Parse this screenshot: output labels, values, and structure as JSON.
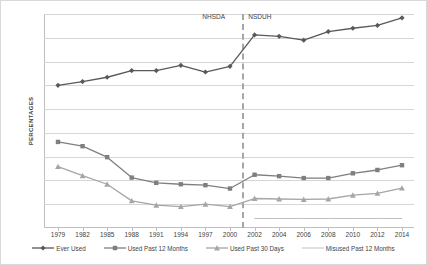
{
  "chart_data": {
    "type": "line",
    "title": "",
    "xlabel": "",
    "ylabel": "PERCENTAGES",
    "ylim": [
      0,
      45
    ],
    "ytick_step": 5,
    "yticks": [
      0,
      5,
      10,
      15,
      20,
      25,
      30,
      35,
      40,
      45
    ],
    "grid": "horizontal",
    "legend_position": "bottom",
    "x": [
      1979,
      1982,
      1985,
      1988,
      1991,
      1994,
      1997,
      2000,
      2002,
      2004,
      2006,
      2008,
      2010,
      2012,
      2014
    ],
    "xtick_labels": [
      "1979",
      "1982",
      "1985",
      "1988",
      "1991",
      "1994",
      "1997",
      "2000",
      "2002",
      "2004",
      "2006",
      "2008",
      "2010",
      "2012",
      "2014"
    ],
    "series": [
      {
        "name": "Ever Used",
        "color": "#595959",
        "marker": "diamond",
        "values": [
          30.0,
          30.8,
          31.7,
          33.1,
          33.1,
          34.2,
          32.8,
          34.0,
          40.6,
          40.3,
          39.5,
          41.3,
          42.0,
          42.6,
          44.2
        ]
      },
      {
        "name": "Used Past 12 Months",
        "color": "#7f7f7f",
        "marker": "square",
        "values": [
          18.1,
          17.2,
          14.9,
          10.6,
          9.5,
          9.2,
          9.0,
          8.3,
          11.2,
          10.9,
          10.5,
          10.5,
          11.5,
          12.2,
          13.2
        ]
      },
      {
        "name": "Used Past 30 Days",
        "color": "#a6a6a6",
        "marker": "triangle",
        "values": [
          12.9,
          11.0,
          9.2,
          5.7,
          4.8,
          4.5,
          5.0,
          4.5,
          6.2,
          6.1,
          6.0,
          6.1,
          6.9,
          7.3,
          8.4
        ]
      },
      {
        "name": "Misused Past 12 Months",
        "color": "#bfbfbf",
        "marker": "none",
        "values": [
          null,
          null,
          null,
          null,
          null,
          null,
          null,
          null,
          2.0,
          2.0,
          2.0,
          2.0,
          2.0,
          2.0,
          2.0
        ]
      }
    ],
    "annotations": [
      {
        "label": "NHSDA",
        "at_x": 2001,
        "side": "left"
      },
      {
        "label": "NSDUH",
        "at_x": 2001,
        "side": "right"
      }
    ],
    "divider": {
      "at_x": 2001,
      "style": "dashed",
      "color": "#a6a6a6"
    }
  }
}
